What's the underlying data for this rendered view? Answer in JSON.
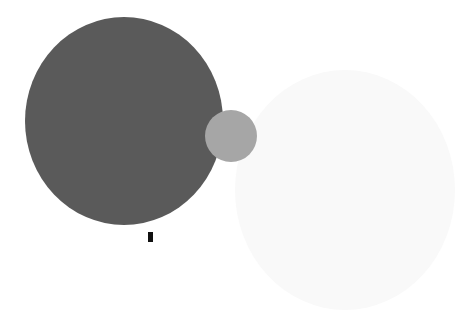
{
  "figure": {
    "shapes": [
      {
        "name": "large-planet",
        "color": "#5a5a5a"
      },
      {
        "name": "small-moon",
        "color": "#a6a6a6"
      },
      {
        "name": "faint-circle",
        "color": "#f9f9f9"
      }
    ],
    "glyph_color": "#111111"
  }
}
